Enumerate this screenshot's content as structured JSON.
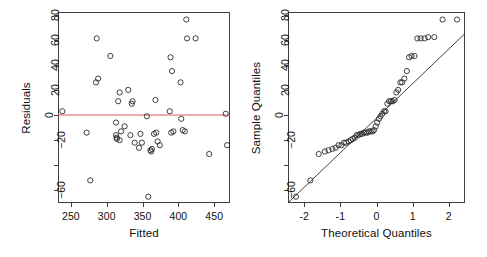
{
  "figure": {
    "width": 487,
    "height": 257,
    "background": "#ffffff",
    "point_color": "#2a2a2a",
    "residual_line_color": "#e8555f",
    "qq_line_color": "#2a2a2a",
    "axis_color": "#3f3f3f"
  },
  "chart_data": [
    {
      "type": "scatter",
      "name": "residuals-vs-fitted",
      "title": "",
      "xlabel": "Fitted",
      "ylabel": "Residuals",
      "xlim": [
        232,
        472
      ],
      "ylim": [
        -70,
        82
      ],
      "xticks": [
        250,
        300,
        350,
        400,
        450
      ],
      "xtick_labels": [
        "250",
        "300",
        "350",
        "400",
        "450"
      ],
      "yticks": [
        -60,
        -40,
        -20,
        0,
        20,
        40,
        60,
        80
      ],
      "ytick_labels": [
        "-60",
        "",
        "-20",
        "0",
        "20",
        "40",
        "60",
        "80"
      ],
      "grid": false,
      "legend": "none",
      "reference_line": {
        "type": "horizontal",
        "y": 0,
        "color": "#e8555f"
      },
      "x": [
        238,
        272,
        277,
        285,
        286,
        288,
        305,
        313,
        313,
        314,
        314,
        316,
        318,
        318,
        320,
        325,
        330,
        333,
        335,
        336,
        339,
        345,
        347,
        349,
        356,
        358,
        361,
        362,
        363,
        366,
        368,
        369,
        371,
        374,
        388,
        389,
        390,
        391,
        393,
        403,
        404,
        406,
        409,
        411,
        412,
        424,
        443,
        466,
        468
      ],
      "y": [
        3,
        -14,
        -52,
        26,
        61,
        29,
        47,
        -6,
        -16,
        -18,
        -19,
        11,
        18,
        -20,
        -13,
        -9,
        20,
        -16,
        9,
        11,
        -22,
        -26,
        -15,
        -22,
        -1,
        -65,
        -28,
        -29,
        -27,
        -15,
        12,
        -14,
        -21,
        -24,
        3,
        46,
        -14,
        35,
        -13,
        26,
        -3,
        -12,
        -13,
        76,
        61,
        61,
        -31,
        1,
        -24
      ]
    },
    {
      "type": "scatter",
      "name": "normal-qq-plot",
      "title": "",
      "xlabel": "Theoretical Quantiles",
      "ylabel": "Sample Quantiles",
      "xlim": [
        -2.45,
        2.45
      ],
      "ylim": [
        -70,
        82
      ],
      "xticks": [
        -2,
        -1,
        0,
        1,
        2
      ],
      "xtick_labels": [
        "-2",
        "-1",
        "0",
        "1",
        "2"
      ],
      "yticks": [
        -60,
        -40,
        -20,
        0,
        20,
        40,
        60,
        80
      ],
      "ytick_labels": [
        "-60",
        "",
        "-20",
        "0",
        "20",
        "40",
        "60",
        "80"
      ],
      "grid": false,
      "legend": "none",
      "reference_line": {
        "type": "qqline",
        "slope": 27.5,
        "intercept": -2.5,
        "color": "#2a2a2a"
      },
      "x": [
        -2.23,
        -1.83,
        -1.6,
        -1.43,
        -1.33,
        -1.22,
        -1.13,
        -1.05,
        -0.97,
        -0.9,
        -0.84,
        -0.77,
        -0.71,
        -0.66,
        -0.6,
        -0.55,
        -0.5,
        -0.45,
        -0.4,
        -0.35,
        -0.3,
        -0.25,
        -0.21,
        -0.16,
        -0.11,
        -0.07,
        -0.02,
        0.02,
        0.07,
        0.11,
        0.16,
        0.21,
        0.25,
        0.3,
        0.35,
        0.4,
        0.45,
        0.5,
        0.55,
        0.6,
        0.66,
        0.71,
        0.77,
        0.84,
        0.9,
        0.97,
        1.05,
        1.13,
        1.22,
        1.33,
        1.43,
        1.6,
        1.83,
        2.23
      ],
      "y": [
        -65,
        -52,
        -31,
        -29,
        -28,
        -27,
        -26,
        -24,
        -24,
        -22,
        -22,
        -21,
        -20,
        -19,
        -18,
        -16,
        -16,
        -15,
        -15,
        -14,
        -14,
        -14,
        -13,
        -13,
        -13,
        -12,
        -9,
        -6,
        -3,
        -1,
        1,
        3,
        3,
        9,
        11,
        11,
        11,
        12,
        18,
        20,
        26,
        26,
        29,
        35,
        46,
        47,
        47,
        61,
        61,
        61,
        62,
        62,
        76,
        76
      ]
    }
  ]
}
